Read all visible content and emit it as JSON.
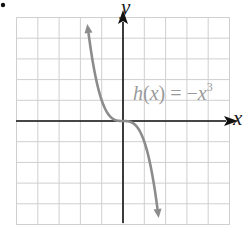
{
  "chart_data": {
    "type": "line",
    "title": "",
    "function_label": "h(x) = -x^3",
    "function_label_parts": {
      "name": "h",
      "arg": "x",
      "equals": "=",
      "neg": "−",
      "var": "x",
      "exp": "3"
    },
    "xlabel": "x",
    "ylabel": "y",
    "xlim": [
      -5,
      5
    ],
    "ylim": [
      -5,
      5
    ],
    "grid": true,
    "grid_step": 1,
    "tick_labels": false,
    "series": [
      {
        "name": "h(x) = -x^3",
        "x": [
          -1.7,
          -1.5,
          -1.25,
          -1.0,
          -0.75,
          -0.5,
          -0.25,
          0,
          0.25,
          0.5,
          0.75,
          1.0,
          1.25,
          1.5,
          1.7
        ],
        "values": [
          4.91,
          3.375,
          1.95,
          1.0,
          0.42,
          0.125,
          0.016,
          0,
          -0.016,
          -0.125,
          -0.42,
          -1.0,
          -1.95,
          -3.375,
          -4.91
        ],
        "color": "#8c8c8c",
        "arrows_both_ends": true
      }
    ],
    "axis_color": "#111111",
    "grid_color": "#cfcfcf"
  },
  "labels": {
    "x_axis": "x",
    "y_axis": "y"
  },
  "marker": "•"
}
